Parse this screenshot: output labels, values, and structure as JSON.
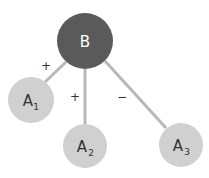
{
  "diagram": {
    "nodes": [
      {
        "id": "B",
        "label": "B",
        "sub": "",
        "cx": 85,
        "cy": 41,
        "r": 28,
        "fill": "#5a5a5a",
        "text_color": "#ffffff"
      },
      {
        "id": "A1",
        "label": "A",
        "sub": "1",
        "cx": 31,
        "cy": 100,
        "r": 23,
        "fill": "#d0d0d0",
        "text_color": "#333333"
      },
      {
        "id": "A2",
        "label": "A",
        "sub": "2",
        "cx": 85,
        "cy": 146,
        "r": 22,
        "fill": "#d0d0d0",
        "text_color": "#333333"
      },
      {
        "id": "A3",
        "label": "A",
        "sub": "3",
        "cx": 181,
        "cy": 145,
        "r": 22,
        "fill": "#d0d0d0",
        "text_color": "#333333"
      }
    ],
    "edges": [
      {
        "from": "B",
        "to": "A1",
        "sign": "+"
      },
      {
        "from": "B",
        "to": "A2",
        "sign": "+"
      },
      {
        "from": "B",
        "to": "A3",
        "sign": "−"
      }
    ],
    "edge_color": "#b8b8b8"
  }
}
